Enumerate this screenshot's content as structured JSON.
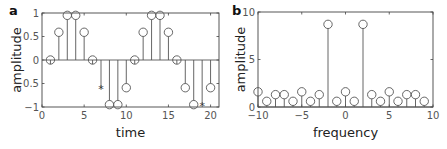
{
  "chart_data": [
    {
      "panel": "a",
      "type": "stem",
      "title": "",
      "xlabel": "time",
      "ylabel": "amplitude",
      "xlim": [
        0,
        21
      ],
      "ylim": [
        -1,
        1
      ],
      "xticks": [
        0,
        5,
        10,
        15,
        20
      ],
      "xtick_labels": [
        "0",
        "5",
        "10",
        "15",
        "20"
      ],
      "yticks": [
        -1,
        -0.5,
        0,
        0.5,
        1
      ],
      "ytick_labels": [
        "−1",
        "−0.5",
        "0",
        "0.5",
        "1"
      ],
      "grid": false,
      "x": [
        1,
        2,
        3,
        4,
        5,
        6,
        7,
        8,
        9,
        10,
        11,
        12,
        13,
        14,
        15,
        16,
        17,
        18,
        19,
        20
      ],
      "values": [
        0,
        0.59,
        0.95,
        0.95,
        0.59,
        0,
        -0.59,
        -0.95,
        -0.95,
        -0.59,
        0,
        0.59,
        0.95,
        0.95,
        0.59,
        0,
        -0.59,
        -0.95,
        -0.95,
        -0.59
      ],
      "markers": [
        "o",
        "o",
        "o",
        "o",
        "o",
        "o",
        "*",
        "o",
        "o",
        "o",
        "o",
        "o",
        "o",
        "o",
        "o",
        "o",
        "o",
        "o",
        "*",
        "o"
      ],
      "annotations": [
        "asterisk markers at t=7 and t=19"
      ]
    },
    {
      "panel": "b",
      "type": "stem",
      "title": "",
      "xlabel": "frequency",
      "ylabel": "amplitude",
      "xlim": [
        -10,
        10
      ],
      "ylim": [
        0,
        10
      ],
      "xticks": [
        -10,
        -5,
        0,
        5,
        10
      ],
      "xtick_labels": [
        "−10",
        "−5",
        "0",
        "5",
        "10"
      ],
      "yticks": [
        0,
        5,
        10
      ],
      "ytick_labels": [
        "0",
        "5",
        "10"
      ],
      "grid": false,
      "x": [
        -10,
        -9,
        -8,
        -7,
        -6,
        -5,
        -4,
        -3,
        -2,
        -1,
        0,
        1,
        2,
        3,
        4,
        5,
        6,
        7,
        8,
        9
      ],
      "values": [
        1.6,
        0.6,
        1.3,
        1.3,
        0.6,
        1.6,
        0.6,
        1.3,
        8.7,
        0.6,
        1.6,
        0.6,
        8.7,
        1.3,
        0.6,
        1.6,
        0.6,
        1.3,
        1.3,
        0.6
      ]
    }
  ],
  "panels": {
    "a": {
      "letter": "a"
    },
    "b": {
      "letter": "b"
    }
  },
  "colors": {
    "line": "#555555",
    "frame": "#444444",
    "text": "#222222"
  }
}
